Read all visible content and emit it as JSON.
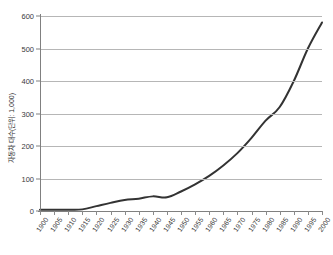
{
  "chart_data": {
    "type": "line",
    "title": "",
    "xlabel": "",
    "ylabel": "자동차 대수(단위: 1,000)",
    "ylim": [
      0,
      600
    ],
    "yticks": [
      0,
      100,
      200,
      300,
      400,
      500,
      600
    ],
    "grid": true,
    "legend": "none",
    "line_color": "#333333",
    "categories": [
      "1900",
      "1905",
      "1910",
      "1915",
      "1920",
      "1925",
      "1930",
      "1935",
      "1940",
      "1945",
      "1950",
      "1955",
      "1960",
      "1965",
      "1970",
      "1975",
      "1980",
      "1985",
      "1990",
      "1995",
      "2000"
    ],
    "values": [
      4,
      4,
      4,
      5,
      15,
      25,
      34,
      38,
      45,
      42,
      60,
      82,
      108,
      140,
      178,
      225,
      278,
      320,
      400,
      500,
      580
    ],
    "series": [
      {
        "name": "자동차 대수",
        "values": [
          4,
          4,
          4,
          5,
          15,
          25,
          34,
          38,
          45,
          42,
          60,
          82,
          108,
          140,
          178,
          225,
          278,
          320,
          400,
          500,
          580
        ]
      }
    ]
  },
  "axes": {
    "y_title": "자동차 대수(단위: 1,000)",
    "y_tick_labels": [
      "600",
      "500",
      "400",
      "300",
      "200",
      "100",
      "0"
    ],
    "x_tick_labels": [
      "1900",
      "1905",
      "1910",
      "1915",
      "1920",
      "1925",
      "1930",
      "1935",
      "1940",
      "1945",
      "1950",
      "1955",
      "1960",
      "1965",
      "1970",
      "1975",
      "1980",
      "1985",
      "1990",
      "1995",
      "2000"
    ]
  }
}
